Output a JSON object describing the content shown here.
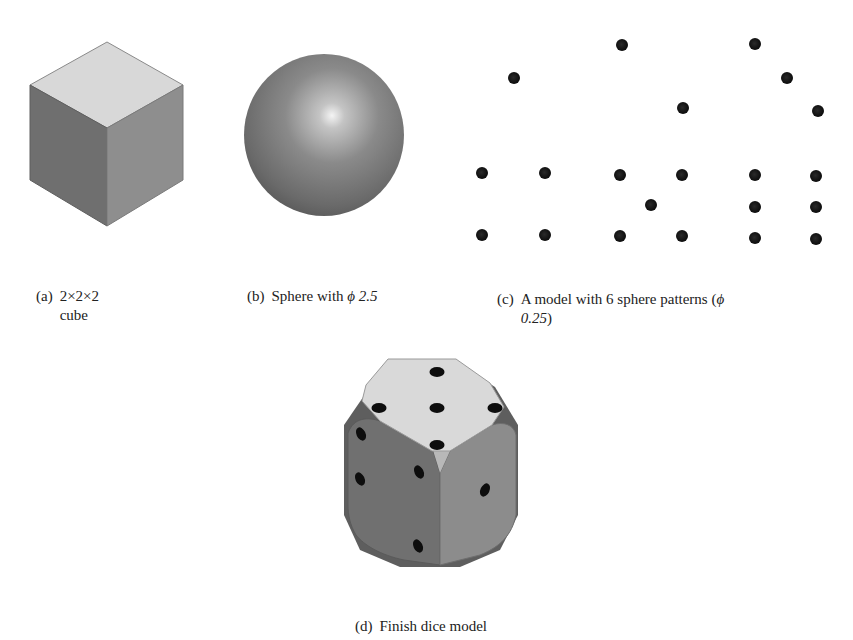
{
  "figures": {
    "a": {
      "tag": "(a)",
      "line1": "2×2×2",
      "line2": "cube",
      "shape": "cube",
      "colors": {
        "top": "#d8d8d8",
        "left": "#6f6f6f",
        "right": "#8e8e8e",
        "edge": "#7a7a7a"
      }
    },
    "b": {
      "tag": "(b)",
      "text_prefix": "Sphere with ",
      "phi": "ϕ",
      "value": "2.5",
      "shape": "sphere",
      "colors": {
        "highlight": "#f4f4f4",
        "mid": "#8a8a8a",
        "shadow": "#5a5a5a"
      }
    },
    "c": {
      "tag": "(c)",
      "text_prefix": "A model with 6 sphere patterns (",
      "phi": "ϕ",
      "line2_value": "0.25",
      "line2_suffix": ")",
      "shape": "dot-patterns",
      "dots": [
        {
          "x": 514,
          "y": 78
        },
        {
          "x": 622,
          "y": 45
        },
        {
          "x": 683,
          "y": 108
        },
        {
          "x": 755,
          "y": 44
        },
        {
          "x": 787,
          "y": 78
        },
        {
          "x": 818,
          "y": 111
        },
        {
          "x": 482,
          "y": 173
        },
        {
          "x": 545,
          "y": 173
        },
        {
          "x": 482,
          "y": 235
        },
        {
          "x": 545,
          "y": 235
        },
        {
          "x": 620,
          "y": 175
        },
        {
          "x": 682,
          "y": 175
        },
        {
          "x": 651,
          "y": 205
        },
        {
          "x": 620,
          "y": 236
        },
        {
          "x": 682,
          "y": 236
        },
        {
          "x": 755,
          "y": 175
        },
        {
          "x": 816,
          "y": 176
        },
        {
          "x": 755,
          "y": 207
        },
        {
          "x": 816,
          "y": 207
        },
        {
          "x": 755,
          "y": 238
        },
        {
          "x": 816,
          "y": 239
        }
      ]
    },
    "d": {
      "tag": "(d)",
      "text": "Finish dice model",
      "shape": "dice",
      "colors": {
        "top": "#d9d9d9",
        "left": "#707070",
        "right": "#8c8c8c",
        "fillet": "#b8b8b8",
        "pip": "#0d0d0d"
      }
    }
  }
}
